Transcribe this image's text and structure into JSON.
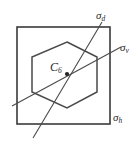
{
  "figure": {
    "background_color": "#ffffff",
    "line_color": "#3a3a3a",
    "text_color": "#2b2b2b",
    "labels": {
      "sigma_d": {
        "symbol": "σ",
        "subscript": "d",
        "full": "σd"
      },
      "sigma_v": {
        "symbol": "σ",
        "subscript": "v",
        "full": "σv"
      },
      "sigma_h": {
        "symbol": "σ",
        "subscript": "h",
        "full": "σh"
      },
      "c6_axis": {
        "symbol": "C",
        "subscript": "6",
        "full": "C6"
      }
    },
    "shapes": {
      "square": {
        "name": "outer-square",
        "x": 17,
        "y": 27,
        "width": 93,
        "height": 97
      },
      "hexagon": {
        "name": "inner-hexagon",
        "points": "67,42 97,57 97,92 67,108 32,92 32,57",
        "center_x": 67,
        "center_y": 74
      },
      "mirror_line_sigma_d": {
        "name": "sigma-d-line",
        "x1": 102,
        "y1": 22,
        "x2": 33,
        "y2": 138
      },
      "mirror_line_sigma_v": {
        "name": "sigma-v-line",
        "x1": 12,
        "y1": 106,
        "x2": 121,
        "y2": 47
      },
      "center_dot": {
        "name": "c6-center-dot",
        "cx": 67,
        "cy": 74,
        "r": 2.1
      }
    }
  }
}
